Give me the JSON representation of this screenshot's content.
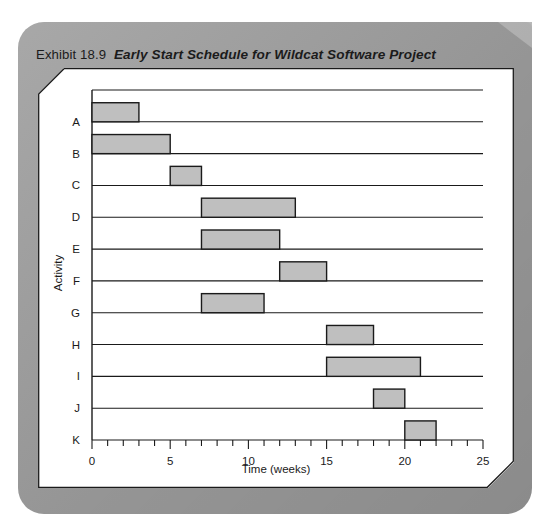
{
  "caption": {
    "exhibit_label": "Exhibit",
    "exhibit_number": "18.9",
    "title": "Early Start Schedule for Wildcat Software Project"
  },
  "colors": {
    "page_panel": "#9e9e9e",
    "page_fold": "#b9b9b9",
    "figure_bg": "#ffffff",
    "bar_fill": "#bfbfbf",
    "bar_stroke": "#1a1a1a",
    "axis": "#1a1a1a",
    "text": "#1a1a1a"
  },
  "chart_data": {
    "type": "bar",
    "orientation": "horizontal",
    "title": "Early Start Schedule for Wildcat Software Project",
    "xlabel": "Time (weeks)",
    "ylabel": "Activity",
    "xlim": [
      0,
      25
    ],
    "ylim_categories": [
      "A",
      "B",
      "C",
      "D",
      "E",
      "F",
      "G",
      "H",
      "I",
      "J",
      "K"
    ],
    "categories": [
      "A",
      "B",
      "C",
      "D",
      "E",
      "F",
      "G",
      "H",
      "I",
      "J",
      "K"
    ],
    "x_major_ticks": [
      0,
      5,
      10,
      15,
      20,
      25
    ],
    "x_major_tick_labels": [
      "0",
      "5",
      "10",
      "15",
      "20",
      "25"
    ],
    "x_minor_tick_interval": 1,
    "grid": "horizontal-baselines-only",
    "legend": "none",
    "bars": [
      {
        "category": "A",
        "start": 0,
        "end": 3,
        "duration": 3
      },
      {
        "category": "B",
        "start": 0,
        "end": 5,
        "duration": 5
      },
      {
        "category": "C",
        "start": 5,
        "end": 7,
        "duration": 2
      },
      {
        "category": "D",
        "start": 7,
        "end": 13,
        "duration": 6
      },
      {
        "category": "E",
        "start": 7,
        "end": 12,
        "duration": 5
      },
      {
        "category": "F",
        "start": 12,
        "end": 15,
        "duration": 3
      },
      {
        "category": "G",
        "start": 7,
        "end": 11,
        "duration": 4
      },
      {
        "category": "H",
        "start": 15,
        "end": 18,
        "duration": 3
      },
      {
        "category": "I",
        "start": 15,
        "end": 21,
        "duration": 6
      },
      {
        "category": "J",
        "start": 18,
        "end": 20,
        "duration": 2
      },
      {
        "category": "K",
        "start": 20,
        "end": 22,
        "duration": 2
      }
    ]
  }
}
